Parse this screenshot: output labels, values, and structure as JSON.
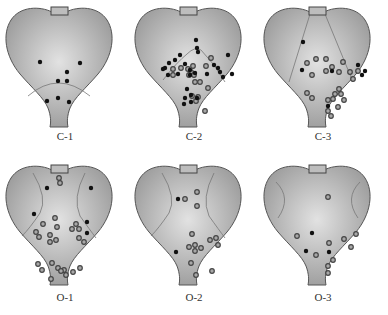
{
  "figure": {
    "colors": {
      "heart_fill_center": "#e2e2e2",
      "heart_fill_edge": "#9a9a9a",
      "outline": "#555555",
      "solid_dot": "#111111",
      "ring_dot_fill": "#a8a8a8",
      "ring_dot_stroke": "#444444"
    },
    "panels": [
      {
        "id": "C-1",
        "label": "C-1",
        "zone": "bottom-arc",
        "solid": [
          [
            40,
            62
          ],
          [
            80,
            63
          ],
          [
            67,
            72
          ],
          [
            58,
            81
          ],
          [
            67,
            81
          ],
          [
            47,
            101
          ],
          [
            58,
            98
          ],
          [
            69,
            102
          ]
        ],
        "ring": []
      },
      {
        "id": "C-2",
        "label": "C-2",
        "zone": "center-arc",
        "solid": [
          [
            67,
            40
          ],
          [
            68,
            48
          ],
          [
            69,
            52
          ],
          [
            51,
            55
          ],
          [
            46,
            60
          ],
          [
            40,
            63
          ],
          [
            36,
            68
          ],
          [
            56,
            64
          ],
          [
            39,
            75
          ],
          [
            34,
            69
          ],
          [
            49,
            74
          ],
          [
            61,
            75
          ],
          [
            61,
            70
          ],
          [
            66,
            73
          ],
          [
            85,
            65
          ],
          [
            89,
            68
          ],
          [
            91,
            72
          ],
          [
            94,
            77
          ],
          [
            99,
            55
          ],
          [
            103,
            74
          ],
          [
            78,
            74
          ],
          [
            58,
            89
          ],
          [
            62,
            95
          ],
          [
            56,
            98
          ],
          [
            62,
            102
          ],
          [
            55,
            104
          ],
          [
            68,
            98
          ]
        ],
        "ring": [
          [
            44,
            69
          ],
          [
            52,
            68
          ],
          [
            59,
            69
          ],
          [
            64,
            66
          ],
          [
            62,
            72
          ],
          [
            65,
            75
          ],
          [
            44,
            75
          ],
          [
            60,
            75
          ],
          [
            77,
            66
          ],
          [
            82,
            58
          ],
          [
            66,
            82
          ],
          [
            71,
            82
          ],
          [
            79,
            88
          ],
          [
            63,
            96
          ],
          [
            69,
            97
          ],
          [
            67,
            101
          ],
          [
            76,
            111
          ]
        ]
      },
      {
        "id": "C-3",
        "label": "C-3",
        "zone": "center-wedge",
        "solid": [
          [
            45,
            42
          ],
          [
            44,
            70
          ],
          [
            74,
            71
          ],
          [
            100,
            65
          ],
          [
            107,
            71
          ],
          [
            104,
            75
          ],
          [
            70,
            106
          ]
        ],
        "ring": [
          [
            49,
            63
          ],
          [
            58,
            59
          ],
          [
            68,
            59
          ],
          [
            85,
            62
          ],
          [
            74,
            67
          ],
          [
            68,
            71
          ],
          [
            81,
            72
          ],
          [
            92,
            72
          ],
          [
            100,
            71
          ],
          [
            95,
            79
          ],
          [
            54,
            75
          ],
          [
            49,
            93
          ],
          [
            54,
            98
          ],
          [
            81,
            89
          ],
          [
            77,
            94
          ],
          [
            83,
            94
          ],
          [
            75,
            99
          ],
          [
            86,
            100
          ],
          [
            70,
            100
          ],
          [
            80,
            107
          ],
          [
            70,
            111
          ],
          [
            73,
            116
          ]
        ]
      },
      {
        "id": "O-1",
        "label": "O-1",
        "zone": "side-lobes",
        "solid": [
          [
            47,
            30
          ],
          [
            91,
            30
          ],
          [
            34,
            56
          ],
          [
            87,
            64
          ],
          [
            87,
            75
          ]
        ],
        "ring": [
          [
            59,
            20
          ],
          [
            60,
            25
          ],
          [
            55,
            60
          ],
          [
            43,
            66
          ],
          [
            57,
            69
          ],
          [
            36,
            74
          ],
          [
            39,
            79
          ],
          [
            50,
            77
          ],
          [
            50,
            84
          ],
          [
            56,
            82
          ],
          [
            76,
            66
          ],
          [
            72,
            71
          ],
          [
            79,
            71
          ],
          [
            79,
            80
          ],
          [
            84,
            84
          ],
          [
            52,
            105
          ],
          [
            38,
            106
          ],
          [
            42,
            112
          ],
          [
            64,
            112
          ],
          [
            58,
            110
          ],
          [
            61,
            113
          ],
          [
            66,
            117
          ],
          [
            73,
            114
          ],
          [
            80,
            110
          ],
          [
            51,
            121
          ]
        ]
      },
      {
        "id": "O-2",
        "label": "O-2",
        "zone": "side-lobes",
        "solid": [
          [
            49,
            41
          ],
          [
            47,
            94
          ]
        ],
        "ring": [
          [
            68,
            34
          ],
          [
            56,
            41
          ],
          [
            68,
            48
          ],
          [
            63,
            76
          ],
          [
            81,
            82
          ],
          [
            87,
            80
          ],
          [
            89,
            87
          ],
          [
            60,
            89
          ],
          [
            66,
            87
          ],
          [
            72,
            90
          ],
          [
            66,
            93
          ],
          [
            62,
            105
          ],
          [
            67,
            117
          ],
          [
            83,
            113
          ]
        ]
      },
      {
        "id": "O-3",
        "label": "O-3",
        "zone": "side-edges",
        "solid": [
          [
            54,
            75
          ],
          [
            48,
            93
          ],
          [
            71,
            94
          ]
        ],
        "ring": [
          [
            70,
            39
          ],
          [
            39,
            78
          ],
          [
            98,
            76
          ],
          [
            86,
            81
          ],
          [
            71,
            85
          ],
          [
            93,
            89
          ],
          [
            58,
            97
          ],
          [
            75,
            102
          ],
          [
            70,
            108
          ],
          [
            70,
            115
          ]
        ]
      }
    ]
  }
}
